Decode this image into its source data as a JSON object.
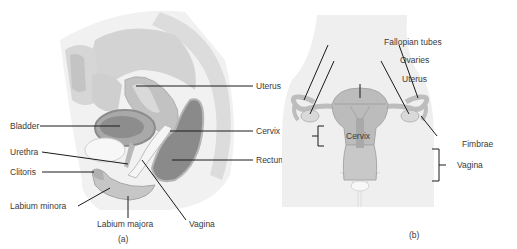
{
  "figure": {
    "panels": [
      {
        "id": "a",
        "caption": "(a)",
        "view": "sagittal section",
        "labels": {
          "uterus": "Uterus",
          "cervix": "Cervix",
          "rectum": "Rectum",
          "bladder": "Bladder",
          "urethra": "Urethra",
          "clitoris": "Clitoris",
          "labium_minora": "Labium minora",
          "labium_majora": "Labium majora",
          "vagina": "Vagina"
        }
      },
      {
        "id": "b",
        "caption": "(b)",
        "view": "frontal view",
        "labels": {
          "fallopian_tubes": "Fallopian tubes",
          "ovaries": "Ovaries",
          "uterus": "Uterus",
          "cervix": "Cervix",
          "fimbrae": "Fimbrae",
          "vagina": "Vagina"
        }
      }
    ],
    "colors": {
      "tissue_light": "#e8e8e8",
      "tissue_mid": "#c9c9c9",
      "tissue_dark": "#9a9a9a",
      "organ_dark": "#7d7d7d",
      "leader_line": "#1a1a1a",
      "body_bg": "#eeeeee"
    }
  }
}
